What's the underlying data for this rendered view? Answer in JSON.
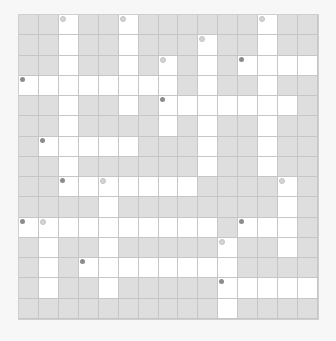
{
  "puzzle": {
    "rows": 15,
    "cols": 15,
    "colors": {
      "block": "#dedede",
      "open": "#ffffff",
      "grid_line": "#c6c6c6",
      "marker_dark": "#8c8c8c",
      "marker_light": "#d4d4d4",
      "background": "#f7f7f7"
    },
    "grid": [
      "BBWBBWBBBBBBWBB",
      "BBWBBWBBBWBBWBB",
      "BBWBBWBWBWBWWWW",
      "WWWWWWWWBWBBWBB",
      "BBWBBWBWWWWWWWB",
      "BBWBBBBWBWBBWBB",
      "BWWWWWBBBWBBWBB",
      "BBWBBBBBBWBBWBB",
      "BBWWWWWWWBBBBWB",
      "BBBBWBBBBBBBBWB",
      "WWWWWWWWWWBWWWB",
      "BWBBWBBBBBWBBWB",
      "BWBWWWWWWWWBBBB",
      "BWBBWBBBBBWWWWW",
      "BBBBBBBBBBWBBBB"
    ],
    "markers": [
      {
        "row": 0,
        "col": 2,
        "style": "light"
      },
      {
        "row": 0,
        "col": 5,
        "style": "light"
      },
      {
        "row": 0,
        "col": 12,
        "style": "light"
      },
      {
        "row": 1,
        "col": 9,
        "style": "light"
      },
      {
        "row": 2,
        "col": 7,
        "style": "light"
      },
      {
        "row": 2,
        "col": 11,
        "style": "dark"
      },
      {
        "row": 3,
        "col": 0,
        "style": "dark"
      },
      {
        "row": 4,
        "col": 7,
        "style": "dark"
      },
      {
        "row": 6,
        "col": 1,
        "style": "dark"
      },
      {
        "row": 8,
        "col": 2,
        "style": "dark"
      },
      {
        "row": 8,
        "col": 4,
        "style": "light"
      },
      {
        "row": 8,
        "col": 13,
        "style": "light"
      },
      {
        "row": 10,
        "col": 0,
        "style": "dark"
      },
      {
        "row": 10,
        "col": 1,
        "style": "light"
      },
      {
        "row": 10,
        "col": 11,
        "style": "dark"
      },
      {
        "row": 11,
        "col": 10,
        "style": "light"
      },
      {
        "row": 12,
        "col": 3,
        "style": "dark"
      },
      {
        "row": 13,
        "col": 10,
        "style": "dark"
      }
    ]
  }
}
